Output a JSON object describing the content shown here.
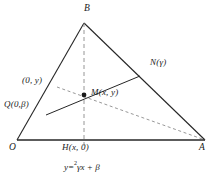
{
  "figure": {
    "stroke_color": "#262626",
    "background": "#ffffff",
    "vertices": {
      "O": {
        "label": "O",
        "x": 17,
        "y": 140
      },
      "A": {
        "label": "A",
        "x": 205,
        "y": 140
      },
      "B": {
        "label": "B",
        "x": 84,
        "y": 23
      },
      "M": {
        "label": "M(x, y)",
        "x": 84,
        "y": 95
      },
      "N": {
        "label": "N(γ)",
        "x": 140,
        "y": 76
      },
      "H": {
        "label": "H(x, 0)",
        "x": 84,
        "y": 140
      },
      "Q": {
        "label": "Q(0,β)",
        "x": 37,
        "y": 108
      },
      "P": {
        "label": "(0, y)",
        "x": 47,
        "y": 84
      }
    },
    "labels": {
      "origin": "O",
      "apex": "B",
      "right": "A",
      "midpoint": "M(x, y)",
      "point_n": "N(γ)",
      "foot": "H(x, 0)",
      "point_q": "Q(0,β)",
      "point_p": "(0, y)"
    },
    "equation": {
      "lhs": "y",
      "relation": "=",
      "exponent": "2",
      "rhs": "γx + β",
      "full": "y = γx + β"
    }
  }
}
